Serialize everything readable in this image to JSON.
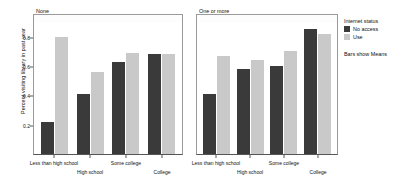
{
  "chart_data": {
    "type": "bar",
    "title": "",
    "xlabel": "",
    "ylabel": "Percent visiting library in past year",
    "ylim": [
      0,
      0.9
    ],
    "yticks": [
      0.2,
      0.4,
      0.6,
      0.8
    ],
    "ytick_labels": [
      "0.2",
      "0.4",
      "0.6",
      "0.8"
    ],
    "grid": false,
    "legend_position": "right",
    "legend_title": "Internet status",
    "legend_note": "Bars show Means",
    "categories": [
      "Less than high school",
      "High school",
      "Some college",
      "College"
    ],
    "panels": [
      {
        "title": "None",
        "series": [
          {
            "name": "No access",
            "values": [
              0.22,
              0.41,
              0.63,
              0.68
            ]
          },
          {
            "name": "Use",
            "values": [
              0.8,
              0.56,
              0.69,
              0.68
            ]
          }
        ]
      },
      {
        "title": "One or more",
        "series": [
          {
            "name": "No access",
            "values": [
              0.41,
              0.58,
              0.6,
              0.85
            ]
          },
          {
            "name": "Use",
            "values": [
              0.67,
              0.64,
              0.7,
              0.82
            ]
          }
        ]
      }
    ],
    "series_colors": {
      "No access": "#3a3a3a",
      "Use": "#c9c9c9"
    }
  },
  "legend": {
    "title": "Internet status",
    "items": [
      {
        "label": "No access",
        "color": "#3a3a3a"
      },
      {
        "label": "Use",
        "color": "#c9c9c9"
      }
    ],
    "note": "Bars show Means"
  }
}
